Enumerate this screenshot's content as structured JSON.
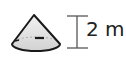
{
  "figure": {
    "shape": "cone",
    "dimension_label": "2 m",
    "dimension_kind": "height",
    "colors": {
      "stroke": "#1a1a1a",
      "fill": "#dcdcdc"
    }
  }
}
